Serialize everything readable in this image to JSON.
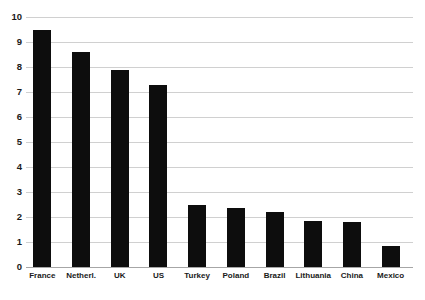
{
  "chart_data": {
    "type": "bar",
    "title": "",
    "subtitle": "",
    "xlabel": "",
    "ylabel": "",
    "categories": [
      "France",
      "Netherl.",
      "UK",
      "US",
      "Turkey",
      "Poland",
      "Brazil",
      "Lithuania",
      "China",
      "Mexico"
    ],
    "values": [
      9.5,
      8.6,
      7.9,
      7.3,
      2.5,
      2.35,
      2.2,
      1.85,
      1.8,
      0.85
    ],
    "series": [
      {
        "name": "",
        "values": [
          9.5,
          8.6,
          7.9,
          7.3,
          2.5,
          2.35,
          2.2,
          1.85,
          1.8,
          0.85
        ]
      }
    ],
    "ylim": [
      0,
      10
    ],
    "ytick_labels": [
      "0",
      "1",
      "2",
      "3",
      "4",
      "5",
      "6",
      "7",
      "8",
      "9",
      "10"
    ],
    "ytick_values": [
      0,
      1,
      2,
      3,
      4,
      5,
      6,
      7,
      8,
      9,
      10
    ],
    "grid": true,
    "grid_axis": "y",
    "legend": false,
    "legend_position": "none",
    "bar_color": "#0d0d0d",
    "grid_color": "#d0d0d0",
    "axis_color": "#a6a6a6",
    "background_color": "#ffffff",
    "annotations": []
  }
}
